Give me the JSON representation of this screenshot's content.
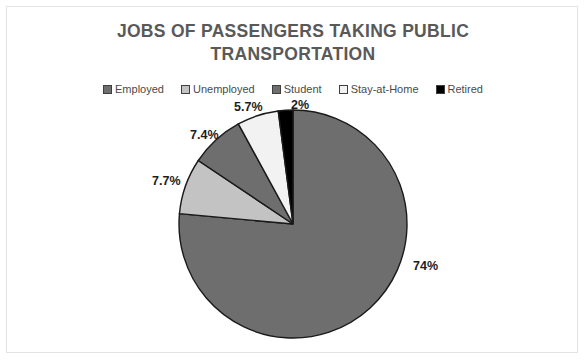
{
  "chart_data": {
    "type": "pie",
    "title": "JOBS OF PASSENGERS TAKING PUBLIC TRANSPORTATION",
    "title_lines": [
      "JOBS OF PASSENGERS TAKING PUBLIC",
      "TRANSPORTATION"
    ],
    "categories": [
      "Employed",
      "Unemployed",
      "Student",
      "Stay-at-Home",
      "Retired"
    ],
    "values": [
      74,
      7.7,
      7.4,
      5.7,
      2
    ],
    "labels": [
      "74%",
      "7.7%",
      "7.4%",
      "5.7%",
      "2%"
    ],
    "colors": [
      "#6e6e6e",
      "#c3c3c3",
      "#6e6e6e",
      "#f2f2f2",
      "#000000"
    ],
    "slice_border_color": "#1a1a1a",
    "legend_position": "top",
    "start_angle_deg": 0,
    "direction": "clockwise",
    "xlabel": "",
    "ylabel": ""
  },
  "legend": {
    "items": [
      {
        "label": "Employed",
        "color": "#6e6e6e"
      },
      {
        "label": "Unemployed",
        "color": "#c3c3c3"
      },
      {
        "label": "Student",
        "color": "#6e6e6e"
      },
      {
        "label": "Stay-at-Home",
        "color": "#f2f2f2"
      },
      {
        "label": "Retired",
        "color": "#000000"
      }
    ]
  },
  "title": {
    "line1": "JOBS OF PASSENGERS TAKING PUBLIC",
    "line2": "TRANSPORTATION"
  },
  "data_labels": {
    "employed": "74%",
    "unemployed": "7.7%",
    "student": "7.4%",
    "stayathome": "5.7%",
    "retired": "2%"
  }
}
